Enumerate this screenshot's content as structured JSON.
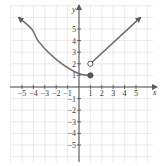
{
  "chart_data": {
    "type": "line",
    "title": "",
    "xlabel": "x",
    "ylabel": "y",
    "xlim": [
      -5.5,
      6.5
    ],
    "ylim": [
      -6.5,
      7
    ],
    "grid": true,
    "x_ticks": [
      -5,
      -4,
      -3,
      -2,
      -1,
      1,
      2,
      3,
      4,
      5
    ],
    "y_ticks": [
      -5,
      -4,
      -3,
      -2,
      -1,
      1,
      2,
      3,
      4,
      5
    ],
    "x_tick_labels": [
      "−5",
      "−4",
      "−3",
      "−2",
      "−1",
      "1",
      "2",
      "3",
      "4",
      "5"
    ],
    "y_tick_labels": [
      "−5",
      "−4",
      "−3",
      "−2",
      "−1",
      "1",
      "2",
      "3",
      "4",
      "5"
    ],
    "series": [
      {
        "name": "left piece (x ≤ 1)",
        "kind": "curve",
        "points": [
          [
            -5.3,
            6.0
          ],
          [
            -4.15,
            5.0
          ],
          [
            -3.6,
            4.0
          ],
          [
            -2.7,
            3.0
          ],
          [
            -1.5,
            2.0
          ],
          [
            0,
            1.15
          ],
          [
            1,
            1
          ]
        ],
        "arrow_start": true,
        "endpoint": {
          "x": 1,
          "y": 1,
          "closed": true
        }
      },
      {
        "name": "right piece (x > 1)",
        "kind": "ray",
        "points": [
          [
            1,
            2
          ],
          [
            5.4,
            6.0
          ]
        ],
        "arrow_end": true,
        "endpoint": {
          "x": 1,
          "y": 2,
          "closed": false
        }
      }
    ],
    "colors": {
      "curve": "#6a6a6a",
      "axis": "#4a4a4a",
      "grid": "#e4e4e4"
    }
  }
}
